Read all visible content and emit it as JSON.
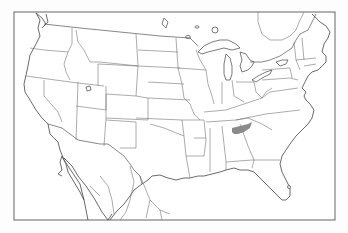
{
  "map": {
    "type": "outline base map",
    "region": "Contiguous United States with parts of Canada and Mexico",
    "labels": [],
    "highlighted_regions": [
      {
        "name": "Northern Alabama / Southern Tennessee range",
        "color": "#8a8a8a"
      }
    ],
    "colors": {
      "background": "#ffffff",
      "lines": "#555555",
      "highlight": "#8a8a8a"
    }
  }
}
